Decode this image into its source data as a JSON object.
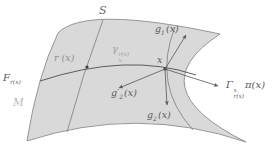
{
  "colors": {
    "background": "#ffffff",
    "surface_fill": "#d9d9d9",
    "outline_stroke": "#8c8c8c",
    "curve_stroke": "#555555",
    "faint_label": "#b8b8b8"
  },
  "labels": {
    "surface": {
      "text": "S"
    },
    "manifold": {
      "text": "M"
    },
    "fiber": {
      "base": "F",
      "sub": "r(x)"
    },
    "point_r": {
      "text": "r (x)"
    },
    "point_x": {
      "text": "x"
    },
    "geodesic": {
      "base": "γ",
      "sup": "r(x)",
      "sub": "x"
    },
    "g1": {
      "base": "g",
      "sub": "1",
      "rest": "(x)"
    },
    "g2": {
      "base": "g",
      "sub": "2",
      "rest": "(x)"
    },
    "g2_prime": {
      "base": "g′",
      "sub": "2",
      "rest": "(x)"
    },
    "transport": {
      "base": "Γ",
      "sup": "x",
      "sub": "r(x)",
      "rest": "π(x)"
    }
  }
}
